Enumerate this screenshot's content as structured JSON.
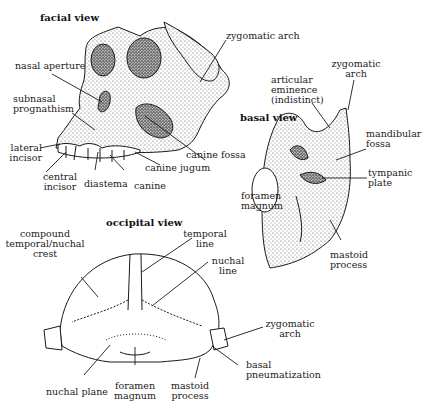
{
  "views": {
    "facial": {
      "title": "facial view",
      "labels": {
        "zygomatic_arch": "zygomatic arch",
        "nasal_aperture": "nasal aperture",
        "subnasal_1": "subnasal",
        "subnasal_2": "prognathism",
        "lateral_1": "lateral",
        "lateral_2": "incisor",
        "central_1": "central",
        "central_2": "incisor",
        "diastema": "diastema",
        "canine": "canine",
        "canine_jugum": "canine jugum",
        "canine_fossa": "canine fossa"
      }
    },
    "basal": {
      "title": "basal view",
      "labels": {
        "zygomatic_1": "zygomatic",
        "zygomatic_2": "arch",
        "articular_1": "articular",
        "articular_2": "eminence",
        "articular_3": "(indistinct)",
        "mandibular_1": "mandibular",
        "mandibular_2": "fossa",
        "tympanic_1": "tympanic",
        "tympanic_2": "plate",
        "foramen_1": "foramen",
        "foramen_2": "magnum",
        "mastoid_1": "mastoid",
        "mastoid_2": "process"
      }
    },
    "occipital": {
      "title": "occipital view",
      "labels": {
        "compound_1": "compound",
        "compound_2": "temporal/nuchal",
        "compound_3": "crest",
        "temporal_1": "temporal",
        "temporal_2": "line",
        "nuchal_1": "nuchal",
        "nuchal_2": "line",
        "zygomatic_1": "zygomatic",
        "zygomatic_2": "arch",
        "basal_1": "basal",
        "basal_2": "pneumatization",
        "mastoid_1": "mastoid",
        "mastoid_2": "process",
        "foramen_1": "foramen",
        "foramen_2": "magnum",
        "nuchal_plane": "nuchal plane"
      }
    }
  },
  "colors": {
    "ink": "#1a1a1a",
    "background": "#ffffff"
  }
}
